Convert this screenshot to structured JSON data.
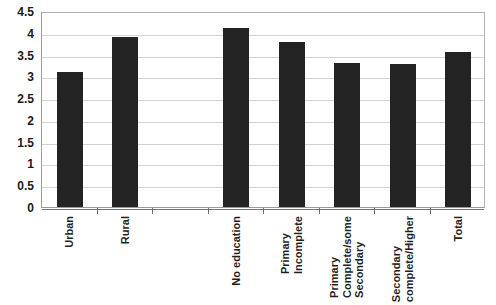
{
  "chart_data": {
    "type": "bar",
    "title": "",
    "subtitle": "",
    "xlabel": "",
    "ylabel": "",
    "ylim": [
      0,
      4.5
    ],
    "ytick_step": 0.5,
    "yticks": [
      "4.5",
      "4",
      "3.5",
      "3",
      "2.5",
      "2",
      "1.5",
      "1",
      "0.5",
      "0"
    ],
    "ytick_values": [
      4.5,
      4,
      3.5,
      3,
      2.5,
      2,
      1.5,
      1,
      0.5,
      0
    ],
    "grid": true,
    "legend": "none",
    "categories": [
      "Urban",
      "Rural",
      "",
      "No education",
      "Primary Incomplete",
      "Primary Complete/some Secondary",
      "Secondary complete/Higher",
      "Total"
    ],
    "category_lines": [
      [
        "Urban"
      ],
      [
        "Rural"
      ],
      [
        ""
      ],
      [
        "No education"
      ],
      [
        "Primary",
        "Incomplete"
      ],
      [
        "Primary",
        "Complete/some",
        "Secondary"
      ],
      [
        "Secondary",
        "complete/Higher"
      ],
      [
        "Total"
      ]
    ],
    "values": [
      3.1,
      3.9,
      null,
      4.1,
      3.8,
      3.3,
      3.28,
      3.55
    ],
    "bar_color": "#232323",
    "gridline_color": "#d2d2d2",
    "axis_color": "#707070",
    "background_color": "#ffffff"
  }
}
